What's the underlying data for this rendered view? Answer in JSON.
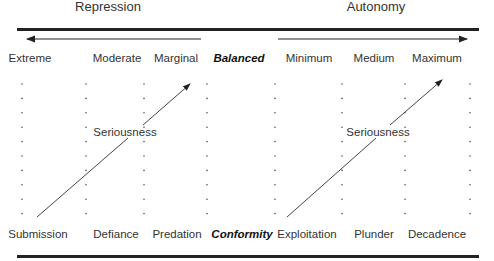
{
  "headers": {
    "left": "Repression",
    "right": "Autonomy"
  },
  "top_labels": [
    "Extreme",
    "Moderate",
    "Marginal",
    "Balanced",
    "Minimum",
    "Medium",
    "Maximum"
  ],
  "bottom_labels": [
    "Submission",
    "Defiance",
    "Predation",
    "Conformity",
    "Exploitation",
    "Plunder",
    "Decadence"
  ],
  "arrows": {
    "left_diagonal_label": "Seriousness",
    "right_diagonal_label": "Seriousness"
  },
  "colors": {
    "line": "#222222",
    "dot": "#555555",
    "text": "#333333"
  }
}
